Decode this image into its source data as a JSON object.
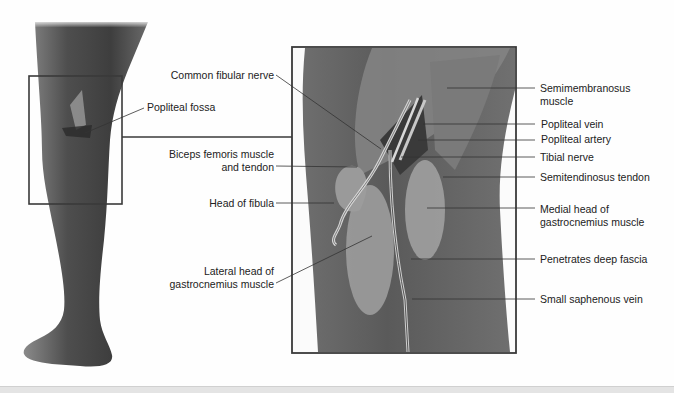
{
  "figure": {
    "overview_label": "Popliteal fossa",
    "left_labels": [
      {
        "id": "common-fibular-nerve",
        "text": "Common fibular nerve"
      },
      {
        "id": "biceps-femoris",
        "line1": "Biceps femoris muscle",
        "line2": "and tendon"
      },
      {
        "id": "head-of-fibula",
        "text": "Head of fibula"
      },
      {
        "id": "lateral-gastrocnemius",
        "line1": "Lateral head of",
        "line2": "gastrocnemius muscle"
      }
    ],
    "right_labels": [
      {
        "id": "semimembranosus",
        "line1": "Semimembranosus",
        "line2": "muscle"
      },
      {
        "id": "popliteal-vein",
        "text": "Popliteal vein"
      },
      {
        "id": "popliteal-artery",
        "text": "Popliteal artery"
      },
      {
        "id": "tibial-nerve",
        "text": "Tibial nerve"
      },
      {
        "id": "semitendinosus",
        "text": "Semitendinosus tendon"
      },
      {
        "id": "medial-gastrocnemius",
        "line1": "Medial head of",
        "line2": "gastrocnemius muscle"
      },
      {
        "id": "penetrates-fascia",
        "text": "Penetrates deep fascia"
      },
      {
        "id": "small-saphenous",
        "text": "Small saphenous vein"
      }
    ]
  },
  "colors": {
    "frame": "#3a3a3a",
    "leader": "#333333",
    "skin_dark": "#4a4a4a",
    "muscle": "#7d7d7d",
    "muscle_light": "#a5a5a5",
    "background": "#fefefe"
  }
}
